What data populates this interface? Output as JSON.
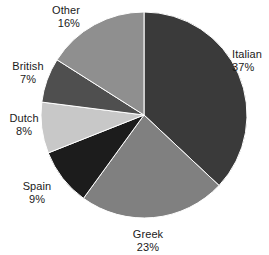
{
  "chart_data": {
    "type": "pie",
    "title": "",
    "subtitle": "",
    "xlabel": "",
    "ylabel": "",
    "legend_position": "none",
    "grid": false,
    "units": "percent",
    "start_angle_deg": 0,
    "direction": "clockwise",
    "total": 100,
    "categories": [
      "Italian",
      "Greek",
      "Spain",
      "Dutch",
      "British",
      "Other"
    ],
    "values": [
      37,
      23,
      9,
      8,
      7,
      16
    ],
    "colors": [
      "#3a3a3a",
      "#808080",
      "#1c1c1c",
      "#c8c8c8",
      "#4f4f4f",
      "#8f8f8f"
    ],
    "slices": [
      {
        "name": "Italian",
        "value": 37,
        "value_label": "37%",
        "color": "#3a3a3a",
        "label_align": "left"
      },
      {
        "name": "Greek",
        "value": 23,
        "value_label": "23%",
        "color": "#808080",
        "label_align": "center"
      },
      {
        "name": "Spain",
        "value": 9,
        "value_label": "9%",
        "color": "#1c1c1c",
        "label_align": "center"
      },
      {
        "name": "Dutch",
        "value": 8,
        "value_label": "8%",
        "color": "#c8c8c8",
        "label_align": "center"
      },
      {
        "name": "British",
        "value": 7,
        "value_label": "7%",
        "color": "#4f4f4f",
        "label_align": "center"
      },
      {
        "name": "Other",
        "value": 16,
        "value_label": "16%",
        "color": "#8f8f8f",
        "label_align": "right"
      }
    ],
    "geometry": {
      "center_x": 144,
      "center_y": 115,
      "radius": 103,
      "stroke": "#ffffff",
      "stroke_width": 1
    }
  }
}
